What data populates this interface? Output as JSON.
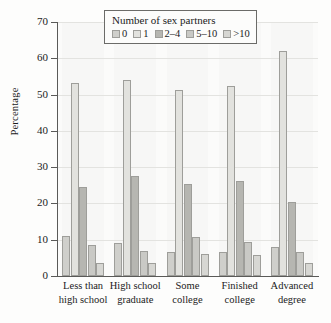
{
  "chart_data": {
    "type": "bar",
    "title": "",
    "subtitle": "",
    "xlabel": "",
    "ylabel": "Percentage",
    "ylim": [
      0,
      70
    ],
    "yticks": [
      0,
      10,
      20,
      30,
      40,
      50,
      60,
      70
    ],
    "ytick_labels": [
      "0",
      "10",
      "20",
      "30",
      "40",
      "50",
      "60",
      "70"
    ],
    "grid": true,
    "legend_title": "Number of sex partners",
    "legend_position": "top-center",
    "categories": [
      "Less than high school",
      "High school graduate",
      "Some college",
      "Finished college",
      "Advanced degree"
    ],
    "category_lines": [
      [
        "Less than",
        "high school"
      ],
      [
        "High school",
        "graduate"
      ],
      [
        "Some",
        "college"
      ],
      [
        "Finished",
        "college"
      ],
      [
        "Advanced",
        "degree"
      ]
    ],
    "series": [
      {
        "name": "0",
        "color": "#cfcfcb",
        "values": [
          11.0,
          9.0,
          6.5,
          6.5,
          8.0
        ]
      },
      {
        "name": "1",
        "color": "#e2e2de",
        "values": [
          53.3,
          54.0,
          51.3,
          52.3,
          62.0
        ]
      },
      {
        "name": "2-4",
        "color": "#b6b6b1",
        "values": [
          24.5,
          27.5,
          25.3,
          26.2,
          20.5
        ]
      },
      {
        "name": "5-10",
        "color": "#c9c9c5",
        "values": [
          8.5,
          7.0,
          10.7,
          9.3,
          6.5
        ]
      },
      {
        "name": ">10",
        "color": "#d7d7d3",
        "values": [
          3.5,
          3.5,
          6.0,
          5.7,
          3.7
        ]
      }
    ],
    "legend_entries": [
      "0",
      "1",
      "2–4",
      "5–10",
      ">10"
    ]
  }
}
